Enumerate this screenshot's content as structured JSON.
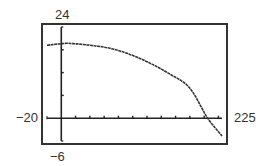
{
  "chart_data": {
    "type": "line",
    "title": "",
    "xlabel": "",
    "ylabel": "",
    "xlim": [
      -20,
      225
    ],
    "ylim": [
      -6,
      24
    ],
    "x_scale_ticks": 20,
    "y_scale_ticks": 6,
    "grid": false,
    "legend": null,
    "window_labels": {
      "xmin": "−20",
      "xmax": "225",
      "ymin": "−6",
      "ymax": "24"
    },
    "series": [
      {
        "name": "curve",
        "x": [
          -20,
          0,
          10,
          40,
          68,
          96,
          124,
          152,
          180,
          205,
          225
        ],
        "y": [
          19.2,
          19.6,
          19.7,
          19.2,
          18.4,
          16.8,
          14.5,
          11.6,
          7.9,
          0,
          -4.7
        ]
      }
    ]
  },
  "colors": {
    "axis": "#222222",
    "curve": "#333333",
    "frame": "#333333",
    "label": "#333333"
  }
}
